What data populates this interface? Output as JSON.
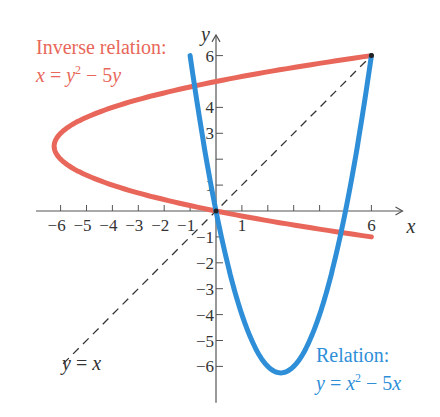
{
  "chart_data": {
    "type": "line",
    "title": "",
    "xlabel": "x",
    "ylabel": "y",
    "xlim": [
      -7,
      7.5
    ],
    "ylim": [
      -7,
      7
    ],
    "grid": false,
    "x_ticks": [
      -6,
      -5,
      -4,
      -3,
      -2,
      -1,
      1,
      6
    ],
    "x_tick_labels": [
      "−6",
      "−5",
      "−4",
      "−3",
      "−2",
      "−1",
      "1",
      "6"
    ],
    "y_ticks": [
      -6,
      -5,
      -4,
      -3,
      -2,
      -1,
      1,
      3,
      4,
      6
    ],
    "y_tick_labels": [
      "−6",
      "−5",
      "−4",
      "−3",
      "−2",
      "−1",
      "1",
      "3",
      "4",
      "6"
    ],
    "series": [
      {
        "name": "Relation: y = x^2 - 5x",
        "color": "#2e8fd8",
        "equation": "y = x^2 - 5x",
        "x_range": [
          -1,
          6
        ],
        "points": [
          [
            -1,
            6
          ],
          [
            0,
            0
          ],
          [
            1,
            -4
          ],
          [
            2,
            -6
          ],
          [
            2.5,
            -6.25
          ],
          [
            3,
            -6
          ],
          [
            4,
            -4
          ],
          [
            5,
            0
          ],
          [
            6,
            6
          ]
        ]
      },
      {
        "name": "Inverse relation: x = y^2 - 5y",
        "color": "#e8675a",
        "equation": "x = y^2 - 5y",
        "y_range": [
          -1,
          6
        ],
        "points": [
          [
            6,
            -1
          ],
          [
            0,
            0
          ],
          [
            -4,
            1
          ],
          [
            -6,
            2
          ],
          [
            -6.25,
            2.5
          ],
          [
            -6,
            3
          ],
          [
            -4,
            4
          ],
          [
            0,
            5
          ],
          [
            6,
            6
          ]
        ]
      },
      {
        "name": "y = x",
        "color": "#333333",
        "style": "dashed",
        "x_range": [
          -6,
          6
        ],
        "points": [
          [
            -6,
            -6
          ],
          [
            6,
            6
          ]
        ]
      }
    ],
    "annotations": [
      {
        "text": "Inverse relation: x = y² − 5y",
        "color": "#e8675a",
        "position": "upper-left"
      },
      {
        "text": "Relation: y = x² − 5x",
        "color": "#2e8fd8",
        "position": "lower-right"
      },
      {
        "text": "y = x",
        "color": "#333333",
        "position": "lower-left"
      }
    ]
  },
  "labels": {
    "inverse_title": "Inverse relation:",
    "inverse_eq_lhs": "x",
    "inverse_eq_mid": " = ",
    "inverse_eq_y": "y",
    "inverse_eq_exp": "2",
    "inverse_eq_rest": " − 5",
    "inverse_eq_tail": "y",
    "relation_title": "Relation:",
    "relation_eq_lhs": "y",
    "relation_eq_mid": " = ",
    "relation_eq_x": "x",
    "relation_eq_exp": "2",
    "relation_eq_rest": " − 5",
    "relation_eq_tail": "x",
    "identity_lhs": "y",
    "identity_mid": " = ",
    "identity_rhs": "x",
    "x_axis_var": "x",
    "y_axis_var": "y"
  }
}
